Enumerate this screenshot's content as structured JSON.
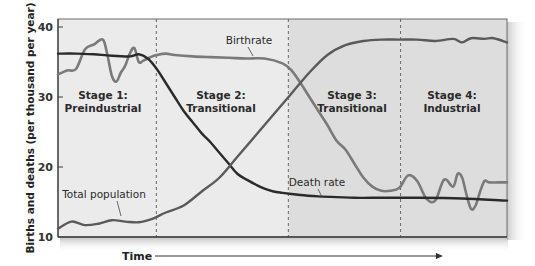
{
  "chart_data": {
    "type": "line",
    "title": "",
    "xlabel": "Time",
    "ylabel": "Births and deaths (per thousand per year)",
    "ylim": [
      10,
      40
    ],
    "yticks": [
      10,
      20,
      30,
      40
    ],
    "xlim": [
      0,
      100
    ],
    "grid": false,
    "legend": "inline annotations",
    "stages": [
      {
        "label_line1": "Stage 1:",
        "label_line2": "Preindustrial",
        "x_start": 0,
        "x_end": 21.9,
        "shade": "#ebebeb"
      },
      {
        "label_line1": "Stage 2:",
        "label_line2": "Transitional",
        "x_start": 21.9,
        "x_end": 51.3,
        "shade": "#ebebeb"
      },
      {
        "label_line1": "Stage 3:",
        "label_line2": "Transitional",
        "x_start": 51.3,
        "x_end": 76.3,
        "shade": "#dddddd"
      },
      {
        "label_line1": "Stage 4:",
        "label_line2": "Industrial",
        "x_start": 76.3,
        "x_end": 100,
        "shade": "#dddddd"
      }
    ],
    "series": [
      {
        "name": "Birthrate",
        "color": "#7a7a7a",
        "x": [
          0,
          2,
          4,
          6,
          8,
          10,
          11,
          12,
          13,
          14,
          15,
          16,
          17,
          18,
          19,
          20,
          21,
          22,
          24,
          26,
          30,
          34,
          38,
          42,
          46,
          50,
          52,
          54,
          56,
          58,
          60,
          62,
          64,
          66,
          68,
          70,
          72,
          74,
          76,
          78,
          80,
          82,
          84,
          86,
          88,
          89,
          90,
          91,
          92,
          93,
          94,
          95,
          96,
          98,
          100
        ],
        "values": [
          33.2,
          33.8,
          34,
          36.8,
          37.5,
          38.2,
          36,
          33,
          32.2,
          33.5,
          34.5,
          36.2,
          37,
          35,
          35.2,
          35.5,
          35.8,
          36,
          36.2,
          36,
          35.8,
          35.7,
          35.6,
          35.5,
          35.5,
          34.8,
          33.8,
          32,
          30,
          28,
          26,
          23.8,
          22.5,
          20.5,
          18.5,
          17.2,
          16.6,
          16.6,
          17,
          18.8,
          18,
          15.5,
          15.2,
          18.2,
          17.2,
          19,
          18.5,
          16,
          14,
          14.5,
          16.5,
          18,
          17.8,
          17.8,
          17.8
        ]
      },
      {
        "name": "Death rate",
        "color": "#2a2a2a",
        "x": [
          0,
          4,
          8,
          12,
          16,
          18,
          20,
          22,
          24,
          26,
          28,
          30,
          32,
          34,
          36,
          38,
          40,
          42,
          44,
          46,
          48,
          50,
          54,
          58,
          62,
          66,
          70,
          80,
          90,
          100
        ],
        "values": [
          36.2,
          36.2,
          36.1,
          35.9,
          35.8,
          36.1,
          35.5,
          34,
          32,
          30,
          28,
          26.4,
          24.8,
          23.5,
          22,
          20.5,
          19,
          18.2,
          17.5,
          16.9,
          16.5,
          16.3,
          16,
          15.8,
          15.7,
          15.6,
          15.6,
          15.6,
          15.5,
          15.2
        ]
      },
      {
        "name": "Total population",
        "color": "#5a5a5a",
        "x": [
          0,
          3,
          6,
          9,
          12,
          15,
          18,
          21,
          24,
          28,
          32,
          36,
          40,
          44,
          48,
          52,
          56,
          60,
          64,
          68,
          72,
          76,
          80,
          84,
          88,
          90,
          92,
          95,
          97,
          100
        ],
        "values": [
          11.2,
          12.2,
          11.7,
          11.9,
          12.4,
          12.2,
          12.1,
          12.6,
          13.5,
          14.5,
          16.5,
          18.5,
          21.5,
          24.5,
          27.5,
          30.5,
          33.5,
          36,
          37.4,
          38,
          38.2,
          38.2,
          38.2,
          38,
          38.3,
          37.8,
          38.4,
          38.3,
          38.4,
          37.8
        ]
      }
    ],
    "annotations": [
      {
        "text": "Birthrate",
        "points_to": "Birthrate"
      },
      {
        "text": "Death rate",
        "points_to": "Death rate"
      },
      {
        "text": "Total population",
        "points_to": "Total population"
      }
    ]
  },
  "axis": {
    "ylabel": "Births and deaths (per thousand per year)",
    "xlabel": "Time",
    "ytick_labels": [
      "40",
      "30",
      "20",
      "10"
    ]
  },
  "stages": [
    {
      "line1": "Stage 1:",
      "line2": "Preindustrial"
    },
    {
      "line1": "Stage 2:",
      "line2": "Transitional"
    },
    {
      "line1": "Stage 3:",
      "line2": "Transitional"
    },
    {
      "line1": "Stage 4:",
      "line2": "Industrial"
    }
  ],
  "labels": {
    "birthrate": "Birthrate",
    "death_rate": "Death rate",
    "total_population": "Total population"
  }
}
